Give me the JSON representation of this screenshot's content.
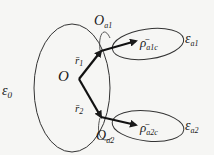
{
  "diagram": {
    "type": "vector-geometry",
    "regions": {
      "main": {
        "symbol": "ε",
        "subscript": "0"
      },
      "upper": {
        "symbol": "ε",
        "subscript": "a1"
      },
      "lower": {
        "symbol": "ε",
        "subscript": "a2"
      }
    },
    "points": {
      "origin": {
        "label": "O"
      },
      "upper_point": {
        "symbol": "O",
        "subscript": "a1"
      },
      "lower_point": {
        "symbol": "O",
        "subscript": "a2"
      }
    },
    "vectors": {
      "r1": {
        "symbol": "r̄",
        "subscript": "1"
      },
      "r2": {
        "symbol": "r̄",
        "subscript": "2"
      },
      "rho_upper": {
        "symbol": "ρ̄",
        "subscript": "a1c"
      },
      "rho_lower": {
        "symbol": "ρ̄",
        "subscript": "a2c"
      }
    },
    "colors": {
      "line": "#1a1a1a",
      "background": "#f6f6f4"
    }
  }
}
